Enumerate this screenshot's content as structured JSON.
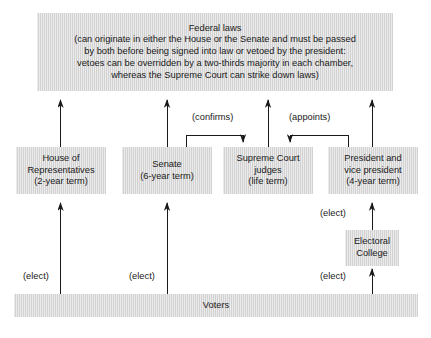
{
  "diagram": {
    "background_color": "#ffffff",
    "node_fill_color": "#d2d2d2",
    "text_color": "#1a1a1a",
    "nodes": {
      "federal_laws": {
        "lines": [
          "Federal laws",
          "(can originate in either the House or the Senate and must be passed",
          "by both before being signed into law or vetoed by the president:",
          "vetoes can be overridden by a two-thirds majority in each chamber,",
          "whereas the Supreme Court can strike down laws)"
        ]
      },
      "house": {
        "lines": [
          "House of",
          "Representatives",
          "(2-year term)"
        ]
      },
      "senate": {
        "lines": [
          "Senate",
          "(6-year term)"
        ]
      },
      "supreme_court": {
        "lines": [
          "Supreme Court",
          "judges",
          "(life term)"
        ]
      },
      "president": {
        "lines": [
          "President and",
          "vice president",
          "(4-year term)"
        ]
      },
      "electoral_college": {
        "lines": [
          "Electoral",
          "College"
        ]
      },
      "voters": {
        "lines": [
          "Voters"
        ]
      }
    },
    "edge_labels": {
      "confirms": "(confirms)",
      "appoints": "(appoints)",
      "elect_house": "(elect)",
      "elect_senate": "(elect)",
      "elect_electoral_college": "(elect)",
      "elect_president": "(elect)"
    }
  }
}
